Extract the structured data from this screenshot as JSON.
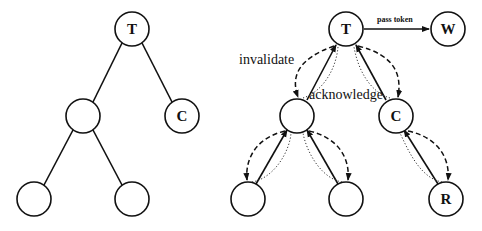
{
  "left_tree": {
    "nodes": [
      {
        "id": "root",
        "label": "T",
        "x": 132,
        "y": 29
      },
      {
        "id": "mid",
        "label": "",
        "x": 83,
        "y": 116
      },
      {
        "id": "c",
        "label": "C",
        "x": 182,
        "y": 116
      },
      {
        "id": "bl",
        "label": "",
        "x": 34,
        "y": 199
      },
      {
        "id": "br",
        "label": "",
        "x": 132,
        "y": 199
      }
    ]
  },
  "right_tree": {
    "nodes": [
      {
        "id": "root",
        "label": "T",
        "x": 346,
        "y": 29
      },
      {
        "id": "w",
        "label": "W",
        "x": 448,
        "y": 29
      },
      {
        "id": "mid",
        "label": "",
        "x": 297,
        "y": 116
      },
      {
        "id": "c",
        "label": "C",
        "x": 396,
        "y": 116
      },
      {
        "id": "bl",
        "label": "",
        "x": 248,
        "y": 199
      },
      {
        "id": "bm",
        "label": "",
        "x": 346,
        "y": 199
      },
      {
        "id": "r",
        "label": "R",
        "x": 446,
        "y": 199
      }
    ],
    "annotations": {
      "pass_token": "pass token",
      "invalidate": "invalidate",
      "acknowledge": "acknowledge"
    }
  }
}
